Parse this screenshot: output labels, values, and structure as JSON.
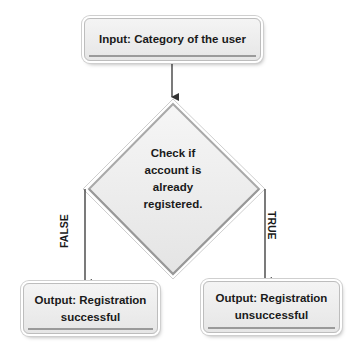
{
  "diagram": {
    "type": "flowchart",
    "input_box": {
      "label": "Input: Category of the user"
    },
    "decision": {
      "lines": [
        "Check if",
        "account is",
        "already",
        "registered."
      ]
    },
    "branches": {
      "false": {
        "label": "FALSE",
        "output": {
          "lines": [
            "Output: Registration",
            "successful"
          ]
        }
      },
      "true": {
        "label": "TRUE",
        "output": {
          "lines": [
            "Output: Registration",
            "unsuccessful"
          ]
        }
      }
    },
    "colors": {
      "box_fill": "#ececec",
      "border": "#bdbdbd",
      "arrow": "#333333",
      "text": "#1a1a1a"
    }
  }
}
